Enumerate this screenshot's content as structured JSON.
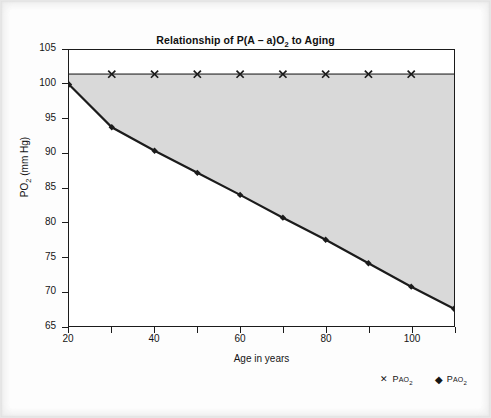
{
  "figure": {
    "title_parts": {
      "pre": "Relationship of P(A – a)O",
      "sub": "2",
      "post": " to Aging"
    },
    "title_plain": "Relationship of P(A – a)O2 to Aging"
  },
  "axes": {
    "x_title": "Age in years",
    "y_title_pre": "PO",
    "y_title_sub": "2",
    "y_title_post": " (mm Hg)",
    "y_title_plain": "PO2 (mm Hg)",
    "y_ticks": [
      65,
      70,
      75,
      80,
      85,
      90,
      95,
      100,
      105
    ],
    "y_tick_labels": [
      "65",
      "70",
      "75",
      "80",
      "85",
      "90",
      "95",
      "100",
      "105"
    ],
    "x_ticks": [
      20,
      30,
      40,
      50,
      60,
      70,
      80,
      90,
      100,
      110
    ],
    "x_tick_labels": [
      "20",
      "",
      "40",
      "",
      "60",
      "",
      "80",
      "",
      "100",
      ""
    ]
  },
  "legend": {
    "position": "below-right",
    "entries": [
      {
        "marker": "X",
        "marker_glyph": "✕",
        "label_p": "P",
        "label_sc": "AO",
        "label_sub": "2",
        "label_plain": "PAO2"
      },
      {
        "marker": "diamond",
        "marker_glyph": "◆",
        "label_p": "P",
        "label_sc": "AO",
        "label_sub": "2",
        "label_plain": "PaO2"
      }
    ]
  },
  "colors": {
    "line": "#1b1b1b",
    "shade": "#d9d9d9",
    "axis": "#1b1b1b",
    "text": "#151515",
    "paper": "#fdfdfd",
    "pao2_line": "#6b6b6b"
  },
  "chart_data": {
    "type": "line",
    "title": "Relationship of P(A – a)O2 to Aging",
    "xlabel": "Age in years",
    "ylabel": "PO2 (mm Hg)",
    "xlim": [
      20,
      110
    ],
    "ylim": [
      65,
      105
    ],
    "grid": false,
    "legend_position": "below-right",
    "shaded_between_series": [
      "PAO2",
      "PaO2"
    ],
    "x": [
      20,
      30,
      40,
      50,
      60,
      70,
      80,
      90,
      100,
      110
    ],
    "series": [
      {
        "name": "PAO2",
        "marker": "X",
        "marker_x": [
          30,
          40,
          50,
          60,
          70,
          80,
          90,
          100
        ],
        "values": [
          101.5,
          101.5,
          101.5,
          101.5,
          101.5,
          101.5,
          101.5,
          101.5,
          101.5,
          101.5
        ]
      },
      {
        "name": "PaO2",
        "marker": "diamond",
        "marker_x": [
          20,
          30,
          40,
          50,
          60,
          70,
          80,
          90,
          100,
          110
        ],
        "values": [
          100.0,
          93.8,
          90.4,
          87.2,
          84.0,
          80.7,
          77.5,
          74.1,
          70.7,
          67.5
        ]
      }
    ]
  }
}
